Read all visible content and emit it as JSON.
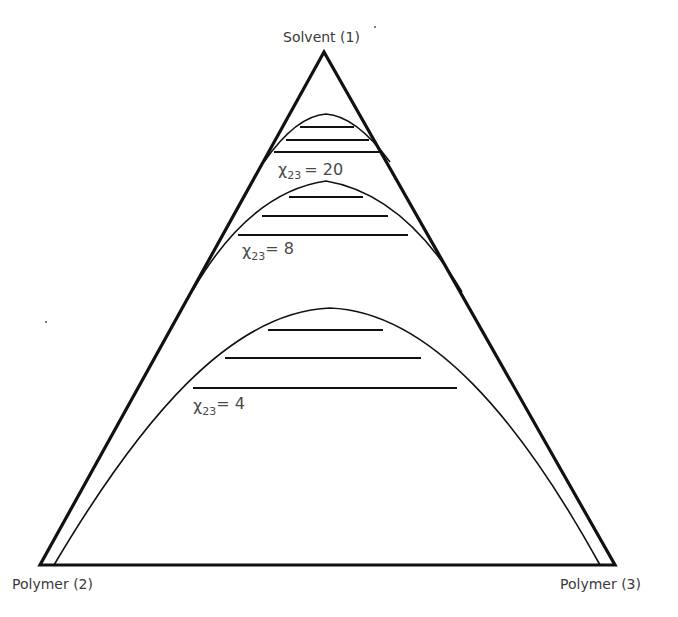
{
  "diagram": {
    "type": "ternary-phase-diagram",
    "vertices": {
      "top": "Solvent (1)",
      "bottom_left": "Polymer (2)",
      "bottom_right": "Polymer (3)"
    },
    "curves": [
      {
        "id": "chi20",
        "label_symbol": "χ",
        "label_subscript": "23",
        "label_value": "= 20",
        "tie_line_count": 3
      },
      {
        "id": "chi8",
        "label_symbol": "χ",
        "label_subscript": "23",
        "label_value": "= 8",
        "tie_line_count": 3
      },
      {
        "id": "chi4",
        "label_symbol": "χ",
        "label_subscript": "23",
        "label_value": "= 4",
        "tie_line_count": 3
      }
    ],
    "colors": {
      "lines": "#111111",
      "text": "#3a3a3a",
      "background": "#ffffff"
    }
  }
}
